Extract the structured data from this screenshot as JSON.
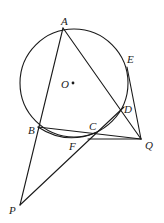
{
  "diagram": {
    "type": "geometry",
    "circle": {
      "label": "O",
      "cx": 74,
      "cy": 83,
      "r": 54
    },
    "points": {
      "A": {
        "label": "A",
        "x": 63,
        "y": 28
      },
      "B": {
        "label": "B",
        "x": 38,
        "y": 127
      },
      "C": {
        "label": "C",
        "x": 95,
        "y": 133
      },
      "D": {
        "label": "D",
        "x": 121,
        "y": 111
      },
      "E": {
        "label": "E",
        "x": 127,
        "y": 67
      },
      "F": {
        "label": "F",
        "x": 88,
        "y": 139
      },
      "P": {
        "label": "P",
        "x": 20,
        "y": 205
      },
      "Q": {
        "label": "Q",
        "x": 141,
        "y": 139
      },
      "O": {
        "label": "O",
        "x": 73,
        "y": 83
      }
    },
    "segments": [
      "A-P",
      "A-Q",
      "B-Q",
      "P-D",
      "E-Q",
      "F-Q",
      "D-Q"
    ],
    "stroke_color": "#1a1a1a"
  }
}
